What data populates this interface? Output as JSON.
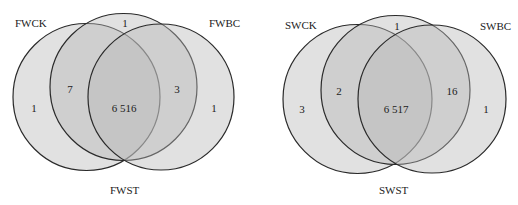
{
  "diagrams": [
    {
      "sets": [
        "FWCK",
        "FWST",
        "FWBC"
      ],
      "regions": {
        "ck_only": "1",
        "st_only": "1",
        "bc_only": "1",
        "ck_st": "7",
        "st_bc": "3",
        "all": "6 516"
      }
    },
    {
      "sets": [
        "SWCK",
        "SWST",
        "SWBC"
      ],
      "regions": {
        "ck_only": "3",
        "st_only": "1",
        "bc_only": "1",
        "ck_st": "2",
        "st_bc": "16",
        "all": "6 517"
      }
    }
  ],
  "colors": {
    "fill": "#b8b8b8",
    "stroke": "#2a2a2a"
  }
}
